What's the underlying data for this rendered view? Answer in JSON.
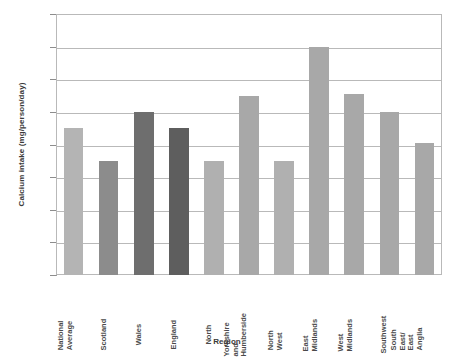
{
  "chart_data": {
    "type": "bar",
    "title": "",
    "xlabel": "Region",
    "ylabel": "Calcium intake (mg/person/day)",
    "ylim": [
      720,
      880
    ],
    "ytick_step": 20,
    "yticks": [
      720,
      740,
      760,
      780,
      800,
      820,
      840,
      860,
      880
    ],
    "grid": true,
    "legend": "none",
    "categories": [
      "National Average",
      "Scotland",
      "Wales",
      "England",
      "North",
      "Yorkshire and Humberside",
      "North West",
      "East Midlands",
      "West Midlands",
      "Southwest",
      "South East/East Anglia"
    ],
    "values": [
      810,
      790,
      820,
      810,
      790,
      830,
      790,
      860,
      831,
      820,
      801
    ],
    "bar_colors": [
      "#b4b4b4",
      "#8c8c8c",
      "#6e6e6e",
      "#5e5e5e",
      "#b0b0b0",
      "#a8a8a8",
      "#b0b0b0",
      "#a8a8a8",
      "#a8a8a8",
      "#a8a8a8",
      "#a8a8a8"
    ]
  },
  "axes": {
    "y_title": "Calcium intake (mg/person/day)",
    "x_title": "Region"
  },
  "colors": {
    "grid": "#b9b9b9",
    "axis": "#9a9a9a",
    "text": "#4a4a4a",
    "background": "#ffffff"
  }
}
